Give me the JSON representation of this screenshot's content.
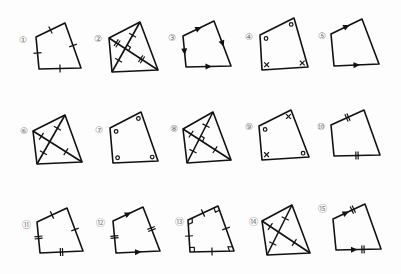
{
  "colors": {
    "line": "#111111",
    "label": "#777777",
    "background": "#fdfdfd"
  },
  "figures": [
    {
      "label": "①",
      "lx": 23,
      "ly": 40,
      "pts": [
        [
          36,
          37
        ],
        [
          65,
          23
        ],
        [
          81,
          68
        ],
        [
          39,
          69
        ]
      ],
      "diagonals": false,
      "marks": {
        "sides": [
          [
            "tick",
            1
          ],
          [
            "tick",
            1
          ],
          [
            "tick",
            1
          ],
          [
            "tick",
            1
          ]
        ]
      }
    },
    {
      "label": "②",
      "lx": 98,
      "ly": 39,
      "pts": [
        [
          109,
          38
        ],
        [
          140,
          22
        ],
        [
          158,
          70
        ],
        [
          112,
          72
        ]
      ],
      "diagonals": true,
      "marks": {
        "diag": [
          [
            "tick",
            2
          ],
          [
            "tick",
            1
          ]
        ],
        "diag_right_angle": true
      }
    },
    {
      "label": "③",
      "lx": 172,
      "ly": 38,
      "pts": [
        [
          183,
          36
        ],
        [
          214,
          21
        ],
        [
          231,
          66
        ],
        [
          186,
          67
        ]
      ],
      "diagonals": false,
      "marks": {
        "sides": [
          [
            "arrow",
            1,
            "fwd"
          ],
          [
            "arrow",
            1,
            "fwd"
          ],
          [
            "arrow",
            1,
            "back"
          ],
          [
            "arrow",
            1,
            "back"
          ]
        ]
      }
    },
    {
      "label": "④",
      "lx": 249,
      "ly": 37,
      "pts": [
        [
          260,
          35
        ],
        [
          294,
          18
        ],
        [
          308,
          67
        ],
        [
          262,
          70
        ]
      ],
      "diagonals": false,
      "marks": {
        "angles": [
          "o",
          "o",
          "x",
          "x"
        ]
      }
    },
    {
      "label": "⑤",
      "lx": 322,
      "ly": 36,
      "pts": [
        [
          331,
          34
        ],
        [
          362,
          19
        ],
        [
          379,
          64
        ],
        [
          334,
          66
        ]
      ],
      "diagonals": false,
      "marks": {
        "sides": [
          [
            "arrow",
            1,
            "fwd"
          ],
          [
            "none"
          ],
          [
            "arrow",
            1,
            "back"
          ],
          [
            "none"
          ]
        ]
      }
    },
    {
      "label": "⑥",
      "lx": 24,
      "ly": 131,
      "pts": [
        [
          33,
          131
        ],
        [
          65,
          115
        ],
        [
          82,
          162
        ],
        [
          37,
          164
        ]
      ],
      "diagonals": true,
      "marks": {
        "diag": [
          [
            "tick",
            1
          ],
          [
            "tick",
            1
          ]
        ],
        "diag_right_angle": false
      }
    },
    {
      "label": "⑦",
      "lx": 99,
      "ly": 130,
      "pts": [
        [
          110,
          128
        ],
        [
          141,
          112
        ],
        [
          158,
          161
        ],
        [
          113,
          163
        ]
      ],
      "diagonals": false,
      "marks": {
        "angles": [
          "o",
          "o",
          "o",
          "o"
        ]
      }
    },
    {
      "label": "⑧",
      "lx": 174,
      "ly": 129,
      "pts": [
        [
          183,
          129
        ],
        [
          213,
          112
        ],
        [
          231,
          160
        ],
        [
          187,
          163
        ]
      ],
      "diagonals": true,
      "marks": {
        "diag": [
          [
            "tick",
            1
          ],
          [
            "tick",
            1
          ]
        ],
        "diag_right_angle": true
      }
    },
    {
      "label": "⑨",
      "lx": 249,
      "ly": 127,
      "pts": [
        [
          259,
          126
        ],
        [
          291,
          110
        ],
        [
          309,
          157
        ],
        [
          262,
          160
        ]
      ],
      "diagonals": false,
      "marks": {
        "angles": [
          "o",
          "x",
          "o",
          "x"
        ]
      }
    },
    {
      "label": "⑩",
      "lx": 321,
      "ly": 127,
      "pts": [
        [
          331,
          125
        ],
        [
          364,
          110
        ],
        [
          380,
          155
        ],
        [
          334,
          156
        ]
      ],
      "diagonals": false,
      "marks": {
        "sides": [
          [
            "tick",
            2
          ],
          [
            "none"
          ],
          [
            "tick",
            2
          ],
          [
            "none"
          ]
        ]
      }
    },
    {
      "label": "⑪",
      "lx": 26,
      "ly": 225,
      "pts": [
        [
          37,
          222
        ],
        [
          67,
          208
        ],
        [
          83,
          251
        ],
        [
          40,
          253
        ]
      ],
      "diagonals": false,
      "marks": {
        "sides": [
          [
            "tick",
            1
          ],
          [
            "tick",
            1
          ],
          [
            "tick",
            2
          ],
          [
            "tick",
            2
          ]
        ]
      }
    },
    {
      "label": "⑫",
      "lx": 100,
      "ly": 223,
      "pts": [
        [
          113,
          221
        ],
        [
          143,
          207
        ],
        [
          160,
          251
        ],
        [
          116,
          253
        ]
      ],
      "diagonals": false,
      "marks": {
        "sides": [
          [
            "arrow",
            1,
            "fwd"
          ],
          [
            "tick",
            2
          ],
          [
            "arrow",
            1,
            "back"
          ],
          [
            "tick",
            2
          ]
        ]
      }
    },
    {
      "label": "⑬",
      "lx": 179,
      "ly": 222,
      "pts": [
        [
          188,
          220
        ],
        [
          218,
          206
        ],
        [
          234,
          251
        ],
        [
          190,
          252
        ]
      ],
      "diagonals": false,
      "marks": {
        "sides": [
          [
            "tick",
            1
          ],
          [
            "tick",
            1
          ],
          [
            "tick",
            1
          ],
          [
            "tick",
            1
          ]
        ],
        "angles": [
          "r",
          "r",
          "r",
          "r"
        ]
      }
    },
    {
      "label": "⑭",
      "lx": 253,
      "ly": 222,
      "pts": [
        [
          262,
          221
        ],
        [
          292,
          205
        ],
        [
          310,
          253
        ],
        [
          267,
          255
        ]
      ],
      "diagonals": true,
      "marks": {
        "diag": [
          [
            "tick",
            1
          ],
          [
            "tick",
            1
          ]
        ],
        "diag_right_angle": false
      }
    },
    {
      "label": "⑮",
      "lx": 322,
      "ly": 209,
      "pts": [
        [
          333,
          219
        ],
        [
          365,
          204
        ],
        [
          381,
          249
        ],
        [
          336,
          250
        ]
      ],
      "diagonals": false,
      "marks": {
        "sides": [
          [
            "arrowtick",
            2,
            "fwd"
          ],
          [
            "none"
          ],
          [
            "arrowtick",
            2,
            "back"
          ],
          [
            "none"
          ]
        ]
      }
    }
  ]
}
